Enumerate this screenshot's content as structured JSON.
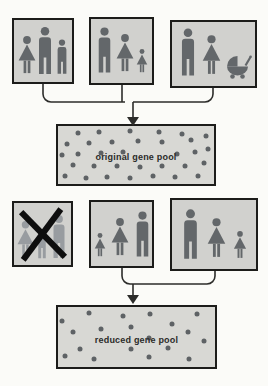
{
  "labels": {
    "original_pool": "original gene pool",
    "reduced_pool": "reduced gene pool"
  },
  "colors": {
    "page_bg": "#fbfbf8",
    "box_bg": "#d1d1ce",
    "box_border": "#1c1c1a",
    "figure": "#63676a",
    "figure_faded": "#989ca0",
    "pool_bg": "#d8d8d4",
    "dot": "#5e6265",
    "line": "#2c2c2a",
    "cross": "#0e0e0e",
    "label": "#2b2b29"
  },
  "top_families": [
    {
      "name": "family-1",
      "members": [
        "woman",
        "man",
        "boy"
      ],
      "crossed_out": false
    },
    {
      "name": "family-2",
      "members": [
        "man",
        "woman",
        "girl"
      ],
      "crossed_out": false
    },
    {
      "name": "family-3",
      "members": [
        "man",
        "woman",
        "pram"
      ],
      "crossed_out": false
    }
  ],
  "bottom_families": [
    {
      "name": "family-4",
      "members": [
        "woman",
        "boy",
        "man"
      ],
      "crossed_out": true
    },
    {
      "name": "family-5",
      "members": [
        "girl",
        "woman",
        "man"
      ],
      "crossed_out": false
    },
    {
      "name": "family-6",
      "members": [
        "man",
        "woman",
        "girl"
      ],
      "crossed_out": false
    }
  ],
  "original_pool_dots": [
    [
      12.9,
      11.6
    ],
    [
      26.3,
      11.0
    ],
    [
      46.1,
      8.8
    ],
    [
      64.7,
      9.9
    ],
    [
      79.3,
      14.4
    ],
    [
      5.6,
      30.9
    ],
    [
      20.1,
      29.8
    ],
    [
      34.6,
      28.2
    ],
    [
      51.2,
      25.4
    ],
    [
      66.8,
      28.2
    ],
    [
      85.5,
      24.3
    ],
    [
      94.8,
      17.1
    ],
    [
      2.5,
      50.3
    ],
    [
      12.9,
      47.5
    ],
    [
      27.4,
      46.4
    ],
    [
      41.9,
      44.8
    ],
    [
      76.1,
      48.6
    ],
    [
      87.6,
      44.8
    ],
    [
      95.9,
      39.2
    ],
    [
      9.8,
      66.9
    ],
    [
      23.2,
      69.6
    ],
    [
      37.8,
      68.5
    ],
    [
      52.3,
      70.7
    ],
    [
      66.8,
      68.5
    ],
    [
      81.3,
      69.6
    ],
    [
      93.8,
      64.1
    ],
    [
      4.6,
      86.2
    ],
    [
      18.0,
      89.0
    ],
    [
      31.5,
      87.3
    ],
    [
      46.1,
      89.0
    ],
    [
      60.6,
      86.2
    ],
    [
      75.1,
      87.3
    ],
    [
      89.6,
      86.2
    ]
  ],
  "reduced_pool_dots": [
    [
      2.5,
      22.9
    ],
    [
      19.9,
      9.6
    ],
    [
      41.5,
      14.9
    ],
    [
      58.9,
      12.2
    ],
    [
      88.7,
      12.2
    ],
    [
      9.7,
      41.5
    ],
    [
      27.1,
      36.2
    ],
    [
      46.6,
      33.5
    ],
    [
      72.3,
      28.2
    ],
    [
      82.5,
      41.5
    ],
    [
      57.9,
      52.1
    ],
    [
      92.8,
      57.4
    ],
    [
      13.8,
      70.7
    ],
    [
      46.6,
      70.7
    ],
    [
      70.2,
      68.1
    ],
    [
      4.5,
      81.4
    ],
    [
      23.0,
      86.7
    ],
    [
      57.9,
      84.0
    ],
    [
      83.6,
      86.7
    ]
  ]
}
